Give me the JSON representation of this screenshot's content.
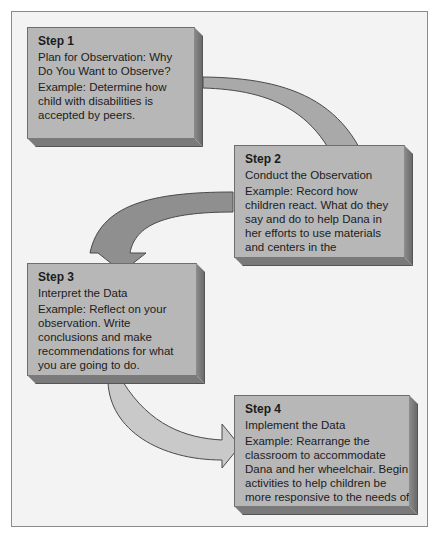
{
  "diagram": {
    "steps": [
      {
        "title": "Step 1",
        "subtitle": "Plan for Observation: Why Do You Want to Observe?",
        "example": "Example: Determine how child with disabilities is accepted by peers."
      },
      {
        "title": "Step 2",
        "subtitle": "Conduct the Observation",
        "example": "Example: Record how children react. What do they say and do to help Dana in her efforts to use materials and centers in the classroom?"
      },
      {
        "title": "Step 3",
        "subtitle": "Interpret the Data",
        "example": "Example: Reflect on your observation. Write conclusions and make recommendations for what you are going to do."
      },
      {
        "title": "Step 4",
        "subtitle": "Implement the Data",
        "example": "Example: Rearrange the classroom to accommodate Dana and her wheelchair. Begin activities to help children be more responsive to the needs of others."
      }
    ],
    "arrows": [
      {
        "from": "Step 1",
        "to": "Step 2",
        "color": "#a9a9a9"
      },
      {
        "from": "Step 2",
        "to": "Step 3",
        "color": "#8f8f8f"
      },
      {
        "from": "Step 3",
        "to": "Step 4",
        "color": "#c9c9c9"
      }
    ],
    "colors": {
      "box_face": "#b7b7b7",
      "box_side": "#6e6e6e",
      "background": "#f3f3f3"
    }
  }
}
